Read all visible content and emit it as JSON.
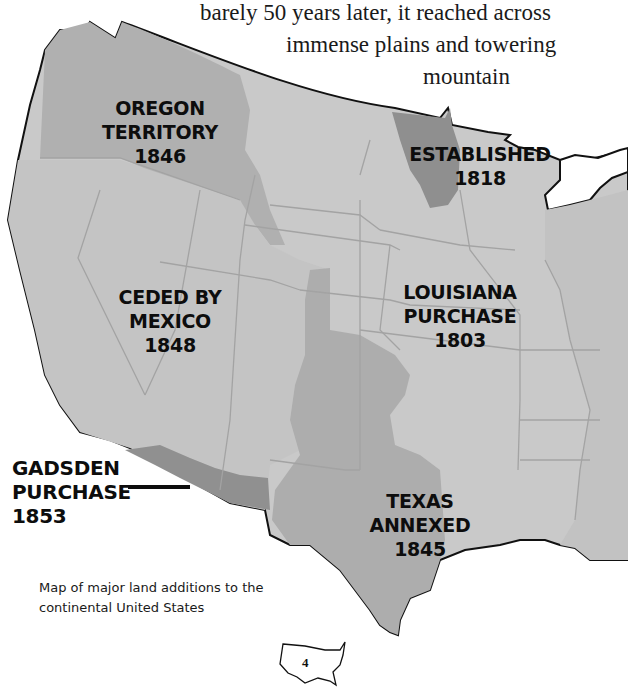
{
  "intro_text": {
    "line1": "barely 50 years later, it reached across",
    "line2": "immense plains and towering",
    "line3": "mountain"
  },
  "regions": [
    {
      "id": "oregon",
      "lines": [
        "OREGON",
        "TERRITORY",
        "1846"
      ]
    },
    {
      "id": "established",
      "lines": [
        "ESTABLISHED",
        "1818"
      ]
    },
    {
      "id": "mexico",
      "lines": [
        "CEDED BY",
        "MEXICO",
        "1848"
      ]
    },
    {
      "id": "louisiana",
      "lines": [
        "LOUISIANA",
        "PURCHASE",
        "1803"
      ]
    },
    {
      "id": "gadsden",
      "lines": [
        "GADSDEN",
        "PURCHASE",
        "1853"
      ]
    },
    {
      "id": "texas",
      "lines": [
        "TEXAS",
        "ANNEXED",
        "1845"
      ]
    }
  ],
  "caption": {
    "line1": "Map of major land additions to the",
    "line2": "continental United States"
  },
  "page_number": "4",
  "colors": {
    "land_light": "#c9c9c9",
    "land_mid": "#b0b0b0",
    "land_dark": "#8f8f8f",
    "border": "#111111",
    "state_line": "#a3a3a3"
  }
}
